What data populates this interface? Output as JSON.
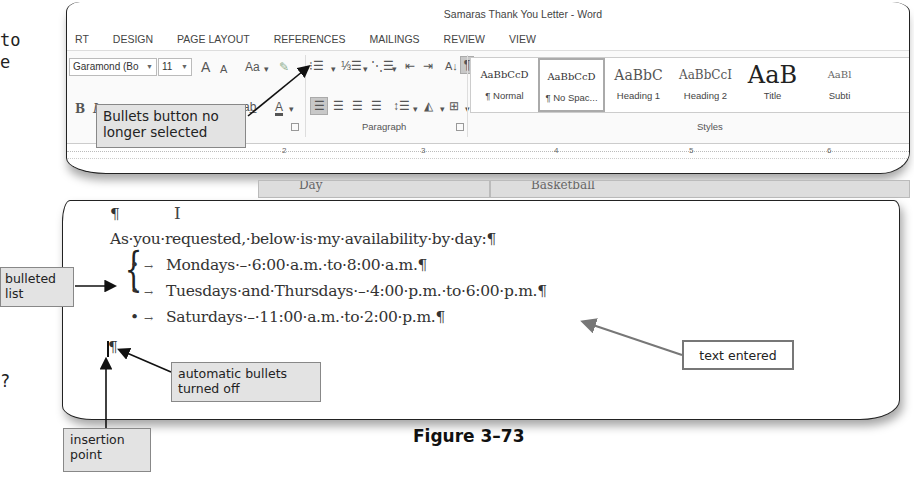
{
  "margin_fragments": [
    "to",
    "e",
    "?"
  ],
  "window": {
    "title": "Samaras Thank You Letter - Word"
  },
  "ribbon": {
    "tabs": [
      "RT",
      "DESIGN",
      "PAGE LAYOUT",
      "REFERENCES",
      "MAILINGS",
      "REVIEW",
      "VIEW"
    ],
    "font_name": "Garamond (Bo",
    "font_size": "11",
    "grow_font": "A",
    "shrink_font": "A",
    "change_case": "Aa",
    "bold": "B",
    "italic": "I",
    "paragraph_group_label": "Paragraph",
    "styles_group_label": "Styles",
    "styles": [
      {
        "sample": "AaBbCcD",
        "name": "¶ Normal"
      },
      {
        "sample": "AaBbCcD",
        "name": "¶ No Spac..."
      },
      {
        "sample": "AaBbC",
        "name": "Heading 1"
      },
      {
        "sample": "AaBbCcI",
        "name": "Heading 2"
      },
      {
        "sample": "AaB",
        "name": "Title"
      },
      {
        "sample": "AaBl",
        "name": "Subti"
      }
    ],
    "show_hide_symbol": "¶"
  },
  "ruler": {
    "numbers": [
      "2",
      "3",
      "4",
      "5",
      "6"
    ]
  },
  "document": {
    "table_peek": [
      "Day",
      "Basketball"
    ],
    "empty_paragraph": "¶",
    "intro_line": "As·you·requested,·below·is·my·availability·by·day:¶",
    "bullets": [
      "Mondays·–·6:00·a.m.·to·8:00·a.m.¶",
      "Tuesdays·and·Thursdays·–·4:00·p.m.·to·6:00·p.m.¶",
      "Saturdays·–·11:00·a.m.·to·2:00·p.m.¶"
    ],
    "bullet_symbol": "•",
    "tab_symbol": "→",
    "final_paragraph": "¶"
  },
  "callouts": {
    "bullets_button": "Bullets button no longer selected",
    "bulleted_list": "bulleted list",
    "text_entered": "text entered",
    "automatic_bullets": "automatic bullets turned off",
    "insertion_point": "insertion point"
  },
  "figure_caption": "Figure 3–73"
}
